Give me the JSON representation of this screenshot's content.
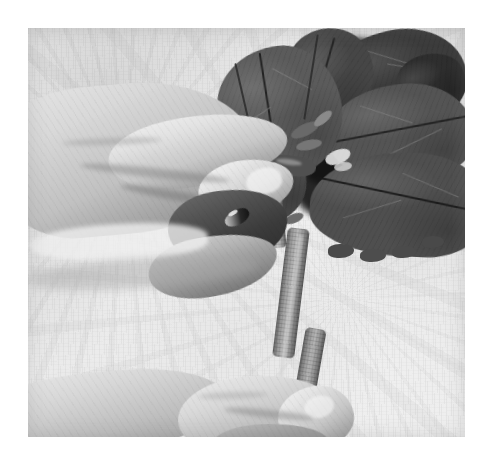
{
  "page": {
    "width": 494,
    "height": 461,
    "background_color": "#ffffff",
    "kind": "photograph"
  },
  "photo": {
    "name": "plant-propagation-photograph",
    "x": 28,
    "y": 28,
    "width": 437,
    "height": 409,
    "color_mode": "black-and-white",
    "alt_text": "Black and white photograph of two hands holding a leafy plant stem, thumb pressing a bud against the cut stem",
    "background_description": "light mottled gray-white woven cloth backdrop",
    "background_color": "#e7e8e8"
  },
  "subjects": {
    "upper_hand": {
      "label": "Upper hand gripping stem",
      "skin_tone": "#c9cac8",
      "shadow_tone": "#6f7170",
      "has_ring": true,
      "ring_color": "#22211f",
      "ring_label": "dark ring on finger"
    },
    "lower_hand": {
      "label": "Lower hand gripping stem base",
      "skin_tone": "#ccccca",
      "shadow_tone": "#8d8f8e"
    },
    "stem": {
      "label": "Woody plant stem with prepared cut",
      "color": "#9a9b99",
      "highlight": "#c4c5c3",
      "shadow": "#5d5f5e"
    },
    "bud": {
      "label": "Bud shield held against stem",
      "color": "#4f5050"
    },
    "foliage": {
      "label": "Dark serrated compound leaves",
      "leaf_color": "#4a4a4a",
      "deep_shadow_color": "#181818",
      "vein_color": "#1f1f1e",
      "count": 7,
      "leaves": [
        {
          "name": "leaf-upper-left",
          "tone": "#5a5a59"
        },
        {
          "name": "leaf-top-center",
          "tone": "#444443"
        },
        {
          "name": "leaf-top-right",
          "tone": "#3b3b3a"
        },
        {
          "name": "leaf-mid-right",
          "tone": "#545453"
        },
        {
          "name": "leaf-lower-right",
          "tone": "#4e4e4d"
        },
        {
          "name": "leaf-lower-left",
          "tone": "#4a4a49"
        },
        {
          "name": "leaf-far-right",
          "tone": "#333332"
        }
      ]
    }
  },
  "palette": {
    "page_white": "#ffffff",
    "backdrop_light": "#ededee",
    "backdrop_mid": "#d8d9d9",
    "skin_light": "#dcdcda",
    "skin_mid": "#b5b6b4",
    "skin_shadow": "#6f7170",
    "leaf_mid": "#4a4a4a",
    "leaf_dark": "#181818",
    "stem_mid": "#9a9b99"
  }
}
